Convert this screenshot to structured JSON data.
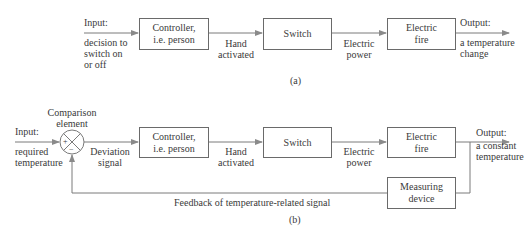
{
  "diagram_a": {
    "input_label": "Input:",
    "input_desc": [
      "decision to",
      "switch on",
      "or off"
    ],
    "controller": [
      "Controller,",
      "i.e. person"
    ],
    "hand_activated": [
      "Hand",
      "activated"
    ],
    "switch": "Switch",
    "electric_power": [
      "Electric",
      "power"
    ],
    "electric_fire": [
      "Electric",
      "fire"
    ],
    "output_label": "Output:",
    "output_desc": [
      "a temperature",
      "change"
    ],
    "caption": "(a)"
  },
  "diagram_b": {
    "comparison_element": [
      "Comparison",
      "element"
    ],
    "plus_sign": "+",
    "minus_sign": "−",
    "input_label": "Input:",
    "input_desc": [
      "required",
      "temperature"
    ],
    "deviation_signal": [
      "Deviation",
      "signal"
    ],
    "controller": [
      "Controller,",
      "i.e. person"
    ],
    "hand_activated": [
      "Hand",
      "activated"
    ],
    "switch": "Switch",
    "electric_power": [
      "Electric",
      "power"
    ],
    "electric_fire": [
      "Electric",
      "fire"
    ],
    "output_label": "Output:",
    "output_desc": [
      "a constant",
      "temperature"
    ],
    "measuring_device": [
      "Measuring",
      "device"
    ],
    "feedback_label": "Feedback of temperature-related signal",
    "caption": "(b)"
  },
  "colors": {
    "line": "#6a6a6a",
    "text": "#3a3a3a"
  }
}
